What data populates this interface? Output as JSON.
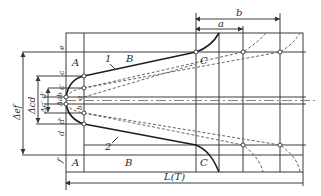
{
  "figure": {
    "type": "tolerance-zone-diagram",
    "region_labels": {
      "A_top": "A",
      "B_top": "B",
      "C_top": "C",
      "A_bottom": "A",
      "B_bottom": "B",
      "C_bottom": "C"
    },
    "curve_labels": {
      "upper": "1",
      "lower": "2"
    },
    "line_labels": {
      "e": "e",
      "c": "c",
      "c_prime": "c′",
      "a_left": "a",
      "b_left": "b",
      "d_prime": "d′",
      "d": "d",
      "f": "f"
    },
    "dimensions": {
      "a": "a",
      "b": "b",
      "length": "L(T)",
      "delta_ef": "Δef",
      "delta_cd": "Δcd",
      "delta_c_d_prime": "Δc′ d′",
      "delta_ab": "Δab"
    },
    "colors": {
      "line": "#3a3a3a",
      "background": "#ffffff"
    }
  }
}
